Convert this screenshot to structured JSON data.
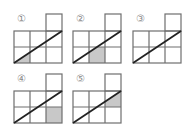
{
  "figures": [
    {
      "label": "①",
      "x": 14,
      "y": 13,
      "shade": "triangle-bottom-left"
    },
    {
      "label": "②",
      "x": 73,
      "y": 13,
      "shade": "trapezoid-bottom-middle"
    },
    {
      "label": "③",
      "x": 133,
      "y": 13,
      "shade": "none"
    },
    {
      "label": "④",
      "x": 14,
      "y": 73,
      "shade": "square-bottom-right"
    },
    {
      "label": "⑤",
      "x": 73,
      "y": 73,
      "shade": "triangle-middle-right"
    }
  ],
  "grid": {
    "cols": 3,
    "rows": 2,
    "cell": 16,
    "extra_cell": "top-right"
  },
  "colors": {
    "line": "#6e6e6e",
    "diagonal": "#222222",
    "shade": "#c8c8c8",
    "label": "#8a8a8a"
  }
}
